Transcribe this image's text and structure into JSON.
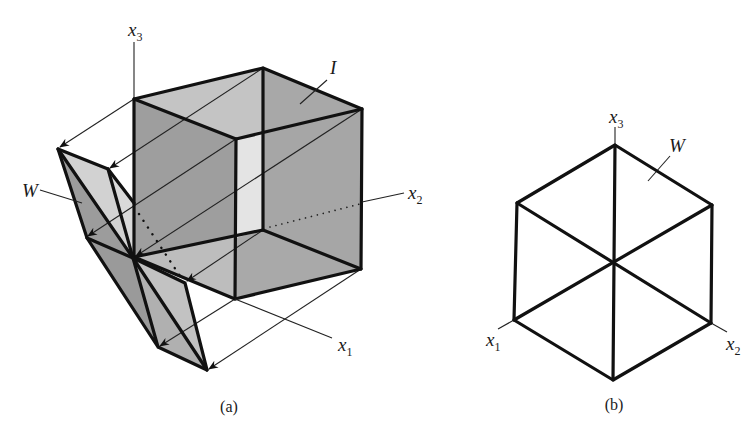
{
  "figure_a": {
    "caption": "(a)",
    "labels": {
      "x3": {
        "base": "x",
        "sub": "3"
      },
      "x2": {
        "base": "x",
        "sub": "2"
      },
      "x1": {
        "base": "x",
        "sub": "1"
      },
      "I": "I",
      "W": "W"
    },
    "colors": {
      "face_dark": "#9a9a9a",
      "face_mid": "#b0b0b0",
      "face_light": "#c8c8c8",
      "face_lightest": "#dcdcdc",
      "edge": "#111111"
    }
  },
  "figure_b": {
    "caption": "(b)",
    "labels": {
      "x3": {
        "base": "x",
        "sub": "3"
      },
      "x2": {
        "base": "x",
        "sub": "2"
      },
      "x1": {
        "base": "x",
        "sub": "1"
      },
      "W": "W"
    }
  }
}
